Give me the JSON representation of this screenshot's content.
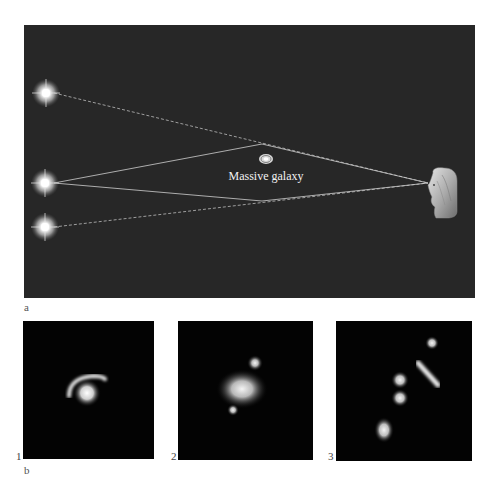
{
  "figure": {
    "panel_a": {
      "label": "a",
      "galaxy_label": "Massive galaxy",
      "elements": {
        "sources": [
          "image-star-top",
          "source-star-middle",
          "image-star-bottom"
        ],
        "lens": "massive-galaxy",
        "observer": "observer-head"
      },
      "colors": {
        "background": "#272727",
        "light_ray": "#cfcfcf",
        "dashed_ray": "#bdbdbd",
        "label_text": "#f2f2f2"
      }
    },
    "panel_b": {
      "label": "b",
      "subpanels": [
        {
          "number": "1",
          "description": "Arc around galaxy"
        },
        {
          "number": "2",
          "description": "Galaxy with two lensed images"
        },
        {
          "number": "3",
          "description": "Multiple lensed images"
        }
      ],
      "colors": {
        "background": "#030303"
      }
    }
  }
}
